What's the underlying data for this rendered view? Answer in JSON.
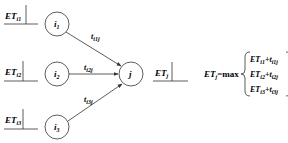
{
  "diagram": {
    "type": "activity-network-earliest-time",
    "nodes": [
      {
        "id": "i1",
        "label": "i",
        "sub": "1",
        "cx": 57,
        "cy": 24,
        "r": 12
      },
      {
        "id": "i2",
        "label": "i",
        "sub": "2",
        "cx": 57,
        "cy": 74,
        "r": 12
      },
      {
        "id": "i3",
        "label": "i",
        "sub": "3",
        "cx": 57,
        "cy": 127,
        "r": 12
      },
      {
        "id": "j",
        "label": "j",
        "sub": "",
        "cx": 131,
        "cy": 74,
        "r": 12
      }
    ],
    "edges": [
      {
        "from": "i1",
        "to": "j",
        "label": "t",
        "sub": "i1j"
      },
      {
        "from": "i2",
        "to": "j",
        "label": "t",
        "sub": "i2j"
      },
      {
        "from": "i3",
        "to": "j",
        "label": "t",
        "sub": "i3j"
      }
    ],
    "time_labels": [
      {
        "id": "ET_i1",
        "main": "ET",
        "sub": "i1"
      },
      {
        "id": "ET_i2",
        "main": "ET",
        "sub": "i2"
      },
      {
        "id": "ET_i3",
        "main": "ET",
        "sub": "i3"
      },
      {
        "id": "ET_j",
        "main": "ET",
        "sub": "j"
      }
    ],
    "formula": {
      "lhs_main": "ET",
      "lhs_sub": "j",
      "operator": "=max",
      "terms": [
        {
          "et_sub": "i1",
          "t_sub": "i1j"
        },
        {
          "et_sub": "i2",
          "t_sub": "i2j"
        },
        {
          "et_sub": "i3",
          "t_sub": "i3j"
        }
      ],
      "plus": "+",
      "et": "ET",
      "t": "t"
    }
  }
}
